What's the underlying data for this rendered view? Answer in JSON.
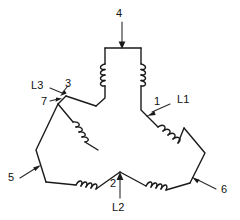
{
  "diagram": {
    "colors": {
      "background": "#ffffff",
      "wire": "#1a1a1a",
      "label_text": "#111111",
      "leader": "#2a2a2a"
    },
    "labels": {
      "terminal_4": "4",
      "terminal_3": "3",
      "terminal_7": "7",
      "terminal_1": "1",
      "terminal_5": "5",
      "terminal_2": "2",
      "terminal_6": "6",
      "line_l1": "L1",
      "line_l2": "L2",
      "line_l3": "L3"
    },
    "terminals": [
      {
        "id": "4",
        "label": "4",
        "arrow": "down",
        "target": "top-winding-bar"
      },
      {
        "id": "3",
        "label": "3",
        "arrow": "down-left",
        "target": "left-upper-vertex"
      },
      {
        "id": "7",
        "label": "7",
        "arrow": "right",
        "target": "left-upper-vertex"
      },
      {
        "id": "1",
        "label": "1",
        "arrow": "down-left",
        "target": "right-upper-vertex"
      },
      {
        "id": "5",
        "label": "5",
        "arrow": "up-right",
        "target": "bottom-left-vertex"
      },
      {
        "id": "2",
        "label": "2",
        "arrow": "up",
        "target": "bottom-center-vertex"
      },
      {
        "id": "6",
        "label": "6",
        "arrow": "up-left",
        "target": "bottom-right-vertex"
      }
    ],
    "lines": [
      {
        "id": "L1",
        "label": "L1",
        "near_terminal": "1"
      },
      {
        "id": "L2",
        "label": "L2",
        "near_terminal": "2"
      },
      {
        "id": "L3",
        "label": "L3",
        "near_terminal": "3"
      }
    ],
    "windings": [
      {
        "id": "top-left-leg",
        "coil_turns": 4,
        "orientation": "vertical"
      },
      {
        "id": "top-right-leg",
        "coil_turns": 4,
        "orientation": "vertical"
      },
      {
        "id": "left-diagonal",
        "coil_turns": 4,
        "orientation": "diagonal"
      },
      {
        "id": "right-diagonal",
        "coil_turns": 4,
        "orientation": "diagonal"
      },
      {
        "id": "bottom-left-arm",
        "coil_turns": 4,
        "orientation": "diagonal"
      },
      {
        "id": "bottom-right-arm",
        "coil_turns": 4,
        "orientation": "diagonal"
      }
    ]
  }
}
